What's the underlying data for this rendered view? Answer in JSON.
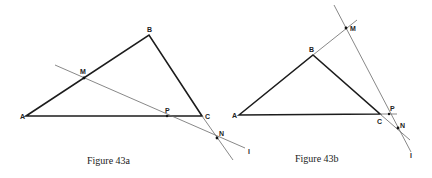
{
  "figures": [
    {
      "id": "43a",
      "caption": "Figure 43a",
      "labels": {
        "A": "A",
        "B": "B",
        "C": "C",
        "M": "M",
        "P": "P",
        "N": "N",
        "l": "l"
      }
    },
    {
      "id": "43b",
      "caption": "Figure 43b",
      "labels": {
        "A": "A",
        "B": "B",
        "C": "C",
        "M": "M",
        "P": "P",
        "N": "N",
        "l": "l"
      }
    }
  ],
  "colors": {
    "line": "#1c1c1c",
    "thin_line": "#6a6a6a",
    "background": "#ffffff"
  }
}
